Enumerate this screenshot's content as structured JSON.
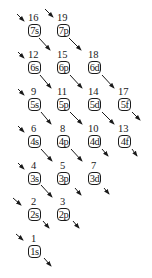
{
  "diagram": {
    "type": "aufbau-orbital-filling-order",
    "orbitals": [
      {
        "label": "7s",
        "col": 0,
        "row": 0,
        "order": "16"
      },
      {
        "label": "7p",
        "col": 1,
        "row": 0,
        "order": "19"
      },
      {
        "label": "6s",
        "col": 0,
        "row": 1,
        "order": "12"
      },
      {
        "label": "6p",
        "col": 1,
        "row": 1,
        "order": "15"
      },
      {
        "label": "6d",
        "col": 2,
        "row": 1,
        "order": "18"
      },
      {
        "label": "5s",
        "col": 0,
        "row": 2,
        "order": "9"
      },
      {
        "label": "5p",
        "col": 1,
        "row": 2,
        "order": "11"
      },
      {
        "label": "5d",
        "col": 2,
        "row": 2,
        "order": "14"
      },
      {
        "label": "5f",
        "col": 3,
        "row": 2,
        "order": "17"
      },
      {
        "label": "4s",
        "col": 0,
        "row": 3,
        "order": "6"
      },
      {
        "label": "4p",
        "col": 1,
        "row": 3,
        "order": "8"
      },
      {
        "label": "4d",
        "col": 2,
        "row": 3,
        "order": "10"
      },
      {
        "label": "4f",
        "col": 3,
        "row": 3,
        "order": "13"
      },
      {
        "label": "3s",
        "col": 0,
        "row": 4,
        "order": "4"
      },
      {
        "label": "3p",
        "col": 1,
        "row": 4,
        "order": "5"
      },
      {
        "label": "3d",
        "col": 2,
        "row": 4,
        "order": "7"
      },
      {
        "label": "2s",
        "col": 0,
        "row": 5,
        "order": "2"
      },
      {
        "label": "2p",
        "col": 1,
        "row": 5,
        "order": "3"
      },
      {
        "label": "1s",
        "col": 0,
        "row": 6,
        "order": "1"
      }
    ],
    "arrow_direction": "down-right"
  }
}
